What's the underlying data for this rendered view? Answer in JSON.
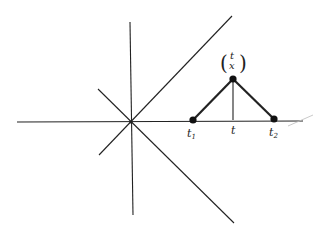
{
  "diagram": {
    "type": "geometric-figure",
    "colors": {
      "line": "#222222",
      "background": "#ffffff",
      "faint": "#bbbbbb"
    },
    "origin": {
      "x": 131,
      "y": 122
    },
    "axes": [
      {
        "name": "horizontal-axis",
        "x1": 17,
        "y1": 122,
        "x2": 303,
        "y2": 121
      },
      {
        "name": "vertical-axis",
        "x1": 130,
        "y1": 22,
        "x2": 133,
        "y2": 215
      }
    ],
    "diagonals": [
      {
        "name": "diagonal-up-right",
        "x1": 99,
        "y1": 155,
        "x2": 232,
        "y2": 16
      },
      {
        "name": "diagonal-down-right",
        "x1": 98,
        "y1": 89,
        "x2": 234,
        "y2": 223
      }
    ],
    "points": [
      {
        "name": "t1-point",
        "x": 193,
        "y": 120
      },
      {
        "name": "peak-point",
        "x": 233,
        "y": 79
      },
      {
        "name": "t2-point",
        "x": 274,
        "y": 119
      }
    ],
    "labels": {
      "t1": {
        "base": "t",
        "sub": "1",
        "x": 187,
        "y": 137
      },
      "t": {
        "text": "t",
        "x": 231,
        "y": 134
      },
      "t2": {
        "base": "t",
        "sub": "2",
        "x": 269,
        "y": 136
      },
      "peak_top": {
        "text": "t",
        "x": 233,
        "y": 57
      },
      "peak_bottom": {
        "text": "x",
        "x": 233,
        "y": 67
      },
      "paren_left": "(",
      "paren_right": ")"
    }
  }
}
